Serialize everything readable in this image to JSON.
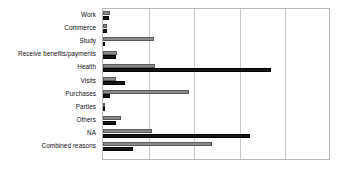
{
  "chart_data": {
    "type": "bar",
    "orientation": "horizontal",
    "title": "",
    "subtitle": "",
    "xlabel": "",
    "ylabel": "",
    "xlim": [
      0,
      50
    ],
    "grid": true,
    "gridline_values": [
      10,
      20,
      30,
      40,
      50
    ],
    "legend_position": "none",
    "categories": [
      "Work",
      "Commerce",
      "Study",
      "Receive benefits/payments",
      "Health",
      "Visits",
      "Purchases",
      "Parties",
      "Others",
      "NA",
      "Combined reasons"
    ],
    "series": [
      {
        "name": "Series 2",
        "color": "#8a8a8a",
        "values": [
          1.5,
          0.9,
          11.2,
          3.1,
          11.4,
          2.9,
          18.9,
          0.3,
          3.9,
          10.7,
          23.9
        ]
      },
      {
        "name": "Series 1",
        "color": "#161616",
        "values": [
          1.3,
          0.8,
          0.2,
          2.9,
          36.8,
          4.8,
          1.5,
          0.2,
          2.9,
          32.2,
          6.6
        ]
      }
    ],
    "axis_tick_labels": []
  }
}
